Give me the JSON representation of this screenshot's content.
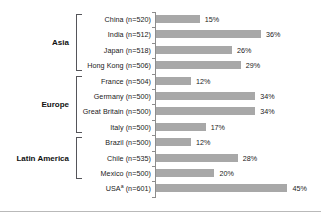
{
  "chart_data": {
    "type": "bar",
    "orientation": "horizontal",
    "title": "",
    "xlabel": "",
    "ylabel": "",
    "xlim": [
      0,
      50
    ],
    "grid": false,
    "legend": null,
    "value_suffix": "%",
    "categories": [
      "China (n=520)",
      "India (n=512)",
      "Japan (n=518)",
      "Hong Kong (n=506)",
      "France (n=504)",
      "Germany (n=500)",
      "Great Britain (n=500)",
      "Italy (n=500)",
      "Brazil (n=500)",
      "Chile (n=535)",
      "Mexico (n=500)",
      "USAᵃ (n=601)"
    ],
    "values": [
      15,
      36,
      26,
      29,
      12,
      34,
      34,
      17,
      12,
      28,
      20,
      45
    ],
    "value_labels": [
      "15%",
      "36%",
      "26%",
      "29%",
      "12%",
      "34%",
      "34%",
      "17%",
      "12%",
      "28%",
      "20%",
      "45%"
    ],
    "bar_color": "#a8a8a8",
    "groups": [
      {
        "label": "Asia",
        "start": 0,
        "end": 3
      },
      {
        "label": "Europe",
        "start": 4,
        "end": 7
      },
      {
        "label": "Latin America",
        "start": 8,
        "end": 10
      }
    ]
  },
  "rows": [
    {
      "name": "China",
      "sample": "n=520",
      "label_main": "China (n=520)",
      "label_sup": "",
      "value": 15,
      "value_label": "15%"
    },
    {
      "name": "India",
      "sample": "n=512",
      "label_main": "India (n=512)",
      "label_sup": "",
      "value": 36,
      "value_label": "36%"
    },
    {
      "name": "Japan",
      "sample": "n=518",
      "label_main": "Japan (n=518)",
      "label_sup": "",
      "value": 26,
      "value_label": "26%"
    },
    {
      "name": "Hong Kong",
      "sample": "n=506",
      "label_main": "Hong Kong (n=506)",
      "label_sup": "",
      "value": 29,
      "value_label": "29%"
    },
    {
      "name": "France",
      "sample": "n=504",
      "label_main": "France (n=504)",
      "label_sup": "",
      "value": 12,
      "value_label": "12%"
    },
    {
      "name": "Germany",
      "sample": "n=500",
      "label_main": "Germany (n=500)",
      "label_sup": "",
      "value": 34,
      "value_label": "34%"
    },
    {
      "name": "Great Britain",
      "sample": "n=500",
      "label_main": "Great Britain (n=500)",
      "label_sup": "",
      "value": 34,
      "value_label": "34%"
    },
    {
      "name": "Italy",
      "sample": "n=500",
      "label_main": "Italy (n=500)",
      "label_sup": "",
      "value": 17,
      "value_label": "17%"
    },
    {
      "name": "Brazil",
      "sample": "n=500",
      "label_main": "Brazil (n=500)",
      "label_sup": "",
      "value": 12,
      "value_label": "12%"
    },
    {
      "name": "Chile",
      "sample": "n=535",
      "label_main": "Chile (n=535)",
      "label_sup": "",
      "value": 28,
      "value_label": "28%"
    },
    {
      "name": "Mexico",
      "sample": "n=500",
      "label_main": "Mexico (n=500)",
      "label_sup": "",
      "value": 20,
      "value_label": "20%"
    },
    {
      "name": "USA",
      "sample": "n=601",
      "label_main": "USA",
      "label_sup": "a",
      "label_tail": " (n=601)",
      "value": 45,
      "value_label": "45%"
    }
  ],
  "groups": [
    {
      "label": "Asia"
    },
    {
      "label": "Europe"
    },
    {
      "label": "Latin America"
    }
  ],
  "colors": {
    "bar": "#a8a8a8",
    "axis": "#8d8d8d",
    "text": "#1a1a1a",
    "bracket": "#55555a",
    "rule": "#b9b9b9",
    "background": "#ffffff"
  }
}
